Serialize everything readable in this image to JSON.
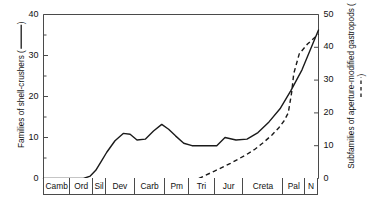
{
  "chart_data": {
    "type": "line",
    "title": "",
    "xlabel": "",
    "grid": false,
    "legend_position": "axis-titles",
    "categories": [
      "Camb",
      "Ord",
      "Sil",
      "Dev",
      "Carb",
      "Pm",
      "Tri",
      "Jur",
      "Creta",
      "Pal",
      "N"
    ],
    "category_spans_myr": [
      52,
      45,
      25,
      57,
      60,
      47,
      51,
      56,
      79,
      43,
      23
    ],
    "axes": {
      "left": {
        "label": "Families of shell-crushers (    )",
        "label_text": "Families of shell-crushers",
        "legend_style": "solid",
        "ylim": [
          0,
          40
        ],
        "major_ticks": [
          0,
          10,
          20,
          30,
          40
        ],
        "minor_ticks": [
          5,
          15,
          25,
          35
        ],
        "tick_labels": [
          "0",
          "10",
          "20",
          "30",
          "40"
        ]
      },
      "right": {
        "label": "Subfamilies of aperture-modified gastropods (- - -)",
        "label_text": "Subfamilies of aperture-modified gastropods",
        "legend_style": "dashed",
        "ylim": [
          0,
          50
        ],
        "major_ticks": [
          0,
          10,
          20,
          30,
          40,
          50
        ],
        "minor_ticks": [
          5,
          15,
          25,
          35,
          45
        ],
        "tick_labels": [
          "0",
          "10",
          "20",
          "30",
          "40",
          "50"
        ]
      }
    },
    "series": [
      {
        "name": "Families of shell-crushers",
        "style": "solid",
        "axis": "left",
        "color": "#1a1a1a",
        "x": [
          0.0,
          8.0,
          14.5,
          17.0,
          19.0,
          21.0,
          23.0,
          26.0,
          29.0,
          31.5,
          34.0,
          37.0,
          40.0,
          43.0,
          45.5,
          48.0,
          51.0,
          54.0,
          57.0,
          60.0,
          63.0,
          66.0,
          70.0,
          74.0,
          78.0,
          82.0,
          86.0,
          90.0,
          94.0,
          98.0,
          100.0
        ],
        "y": [
          0.0,
          0.0,
          0.0,
          0.6,
          2.0,
          4.2,
          6.4,
          9.2,
          11.0,
          10.8,
          9.4,
          9.6,
          11.6,
          13.2,
          12.0,
          10.4,
          8.6,
          8.0,
          8.0,
          8.0,
          8.0,
          10.0,
          9.4,
          9.6,
          11.2,
          13.8,
          17.0,
          21.5,
          26.5,
          33.0,
          36.2
        ]
      },
      {
        "name": "Subfamilies of aperture-modified gastropods",
        "style": "dashed",
        "axis": "right",
        "color": "#1a1a1a",
        "x": [
          56.5,
          59.0,
          62.0,
          65.0,
          68.0,
          71.0,
          74.0,
          77.0,
          80.0,
          83.0,
          85.5,
          87.5,
          89.0,
          90.2,
          91.0,
          93.0,
          96.0,
          100.0
        ],
        "y": [
          0.0,
          1.0,
          2.2,
          3.4,
          4.6,
          6.0,
          7.4,
          9.0,
          11.0,
          13.2,
          15.4,
          17.6,
          20.0,
          26.0,
          32.0,
          38.0,
          41.0,
          44.0
        ]
      }
    ]
  }
}
